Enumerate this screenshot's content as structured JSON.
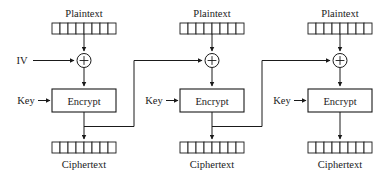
{
  "diagram": {
    "name": "cbc-mode-encryption",
    "width": 387,
    "height": 177,
    "background_color": "#ffffff",
    "line_color": "#1a1a1a",
    "text_color": "#1a1a1a",
    "stage_count": 3,
    "cells_per_block": 8,
    "labels": {
      "plaintext": "Plaintext",
      "ciphertext": "Ciphertext",
      "encrypt": "Encrypt",
      "key": "Key",
      "iv": "IV",
      "xor": "+"
    },
    "stages": [
      {
        "index": 1,
        "plaintext_label": "Plaintext",
        "ciphertext_label": "Ciphertext",
        "encrypt_label": "Encrypt",
        "key_label": "Key",
        "input_label": "IV",
        "has_iv_input": true,
        "has_feedback_out": true,
        "center_x": 84
      },
      {
        "index": 2,
        "plaintext_label": "Plaintext",
        "ciphertext_label": "Ciphertext",
        "encrypt_label": "Encrypt",
        "key_label": "Key",
        "input_label": "",
        "has_iv_input": false,
        "has_feedback_out": true,
        "center_x": 212
      },
      {
        "index": 3,
        "plaintext_label": "Plaintext",
        "ciphertext_label": "Ciphertext",
        "encrypt_label": "Encrypt",
        "key_label": "Key",
        "input_label": "",
        "has_iv_input": false,
        "has_feedback_out": false,
        "center_x": 340
      }
    ]
  }
}
